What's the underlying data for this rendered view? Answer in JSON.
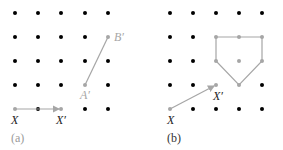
{
  "colors": {
    "dot": "#000000",
    "highlight": "#a6a6a6",
    "caption_a": "#9a9a9a",
    "caption_b": "#333333"
  },
  "grid": {
    "xs_a": [
      15,
      38,
      61,
      85,
      108
    ],
    "xs_b": [
      170,
      193,
      216,
      239,
      262
    ],
    "ys": [
      13,
      37,
      61,
      85,
      109
    ]
  },
  "panel_a": {
    "caption": "(a)",
    "labels": {
      "X": "X",
      "Xp": "X′",
      "Ap": "A′",
      "Bp": "B′"
    },
    "vector": {
      "from": [
        15,
        109
      ],
      "to": [
        61,
        109
      ]
    },
    "segment": {
      "from": [
        85,
        85
      ],
      "to": [
        108,
        37
      ]
    }
  },
  "panel_b": {
    "caption": "(b)",
    "labels": {
      "X": "X",
      "Xp": "X′"
    },
    "vector": {
      "from": [
        170,
        109
      ],
      "to": [
        216,
        85
      ]
    },
    "pentagon": [
      [
        216,
        37
      ],
      [
        239,
        37
      ],
      [
        262,
        37
      ],
      [
        262,
        61
      ],
      [
        239,
        85
      ],
      [
        216,
        61
      ]
    ],
    "center": [
      239,
      61
    ]
  }
}
